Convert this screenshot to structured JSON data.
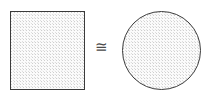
{
  "figure": {
    "background_color": "#ffffff",
    "outline_color": "#3a3a3a",
    "fill_color": "#e8e8e8",
    "fill_pattern": "stipple"
  },
  "shapes": [
    {
      "id": "square",
      "name": "square",
      "label": "",
      "x": 10,
      "y": 11,
      "width": 75,
      "height": 79,
      "fill": "#e8e8e8",
      "stroke": "#3a3a3a"
    },
    {
      "id": "circle",
      "name": "circle",
      "label": "",
      "x": 122,
      "y": 11,
      "width": 79,
      "height": 79,
      "fill": "#e8e8e8",
      "stroke": "#3a3a3a"
    }
  ],
  "relation": {
    "symbol": "≅",
    "name": "congruent-to",
    "x": 100,
    "y": 47,
    "color": "#4a4a4a"
  }
}
